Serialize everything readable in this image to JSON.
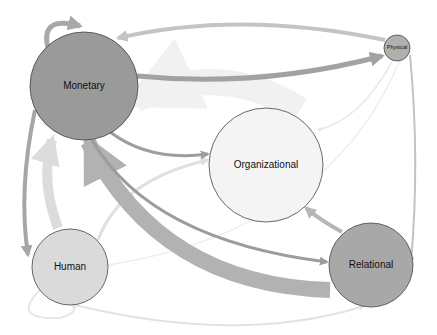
{
  "diagram": {
    "type": "capital-flow-network",
    "nodes": [
      {
        "id": "monetary",
        "label": "Monetary",
        "cx": 84,
        "cy": 86,
        "r": 54,
        "fill": "#9a9a9a",
        "font": 10
      },
      {
        "id": "physical",
        "label": "Physical",
        "cx": 397,
        "cy": 48,
        "r": 13,
        "fill": "#b0b0b0",
        "font": 5.5
      },
      {
        "id": "organizational",
        "label": "Organizational",
        "cx": 266,
        "cy": 165,
        "r": 57,
        "fill": "#f4f4f4",
        "font": 10
      },
      {
        "id": "human",
        "label": "Human",
        "cx": 70,
        "cy": 267,
        "r": 38,
        "fill": "#dadada",
        "font": 10
      },
      {
        "id": "relational",
        "label": "Relational",
        "cx": 371,
        "cy": 265,
        "r": 42,
        "fill": "#a8a8a8",
        "font": 10
      }
    ],
    "edges": [
      {
        "from": "physical",
        "to": "monetary",
        "d": "M385,40 Q240,10 118,38",
        "width": 4,
        "color": "#c4c4c4"
      },
      {
        "from": "monetary",
        "to": "physical",
        "d": "M137,76 Q260,88 382,56",
        "width": 5,
        "color": "#a2a2a2"
      },
      {
        "from": "monetary",
        "to": "monetary",
        "d": "M48,48 Q40,15 80,26",
        "width": 5,
        "color": "#a8a8a8"
      },
      {
        "from": "monetary",
        "to": "organizational",
        "d": "M110,132 Q150,162 208,154",
        "width": 3,
        "color": "#9e9e9e"
      },
      {
        "from": "human",
        "to": "organizational",
        "d": "M98,240 Q120,180 208,160",
        "width": 3,
        "color": "#e0e0e0"
      },
      {
        "from": "monetary",
        "to": "human",
        "d": "M35,110 Q18,190 28,255",
        "width": 4,
        "color": "#a6a6a6"
      },
      {
        "from": "human",
        "to": "monetary",
        "d": "M58,228 Q40,180 52,140",
        "width": 10,
        "color": "#dcdcdc"
      },
      {
        "from": "relational",
        "to": "monetary",
        "d": "M330,290 Q160,285 88,142",
        "width": 16,
        "color": "#b2b2b2"
      },
      {
        "from": "monetary",
        "to": "relational",
        "d": "M92,140 Q150,240 327,262",
        "width": 3,
        "color": "#9c9c9c"
      },
      {
        "from": "relational",
        "to": "organizational",
        "d": "M342,232 Q320,220 306,208",
        "width": 4,
        "color": "#b6b6b6"
      },
      {
        "from": "physical",
        "to": "relational",
        "d": "M410,55 Q420,160 411,262",
        "width": 2,
        "color": "#c2c2c2"
      },
      {
        "from": "physical",
        "to": "organizational",
        "d": "M392,62 Q360,120 318,130",
        "width": 1.5,
        "color": "#e6e6e6"
      },
      {
        "from": "physical",
        "to": "human",
        "d": "M400,60 Q330,230 108,265",
        "width": 1.5,
        "color": "#eeeeee"
      },
      {
        "from": "human",
        "to": "relational",
        "d": "M75,305 Q240,345 364,306",
        "width": 2,
        "color": "#e2e2e2"
      },
      {
        "from": "human",
        "to": "human",
        "d": "M40,290 Q10,320 60,318 Q80,312 72,305",
        "width": 2,
        "color": "#e6e6e6"
      },
      {
        "from": "organizational",
        "to": "monetary",
        "d": "M300,110 Q220,60 135,100",
        "width": 26,
        "color": "#f1f1f1"
      }
    ]
  }
}
